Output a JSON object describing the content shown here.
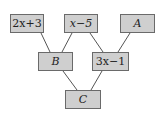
{
  "diagram": {
    "type": "tree",
    "colors": {
      "box_fill": "#cfcfcf",
      "box_border": "#6a6a6a",
      "edge": "#555555"
    },
    "nodes": [
      {
        "id": "n1",
        "label": "2x+3",
        "x": 10,
        "y": 14,
        "w": 34,
        "h": 19
      },
      {
        "id": "n2",
        "label": "x−5",
        "x": 64,
        "y": 14,
        "w": 34,
        "h": 19
      },
      {
        "id": "n3",
        "label": "A",
        "x": 120,
        "y": 14,
        "w": 35,
        "h": 19
      },
      {
        "id": "n4",
        "label": "B",
        "x": 38,
        "y": 52,
        "w": 35,
        "h": 19
      },
      {
        "id": "n5",
        "label": "3x−1",
        "x": 92,
        "y": 52,
        "w": 37,
        "h": 19
      },
      {
        "id": "n6",
        "label": "C",
        "x": 65,
        "y": 90,
        "w": 36,
        "h": 19
      }
    ],
    "edges": [
      {
        "from": "n1",
        "to": "n4",
        "x1": 41,
        "y1": 33,
        "x2": 50,
        "y2": 52
      },
      {
        "from": "n2",
        "to": "n4",
        "x1": 72,
        "y1": 33,
        "x2": 62,
        "y2": 52
      },
      {
        "from": "n2",
        "to": "n5",
        "x1": 90,
        "y1": 33,
        "x2": 103,
        "y2": 52
      },
      {
        "from": "n3",
        "to": "n5",
        "x1": 130,
        "y1": 33,
        "x2": 118,
        "y2": 52
      },
      {
        "from": "n4",
        "to": "n6",
        "x1": 63,
        "y1": 71,
        "x2": 77,
        "y2": 90
      },
      {
        "from": "n5",
        "to": "n6",
        "x1": 102,
        "y1": 71,
        "x2": 91,
        "y2": 90
      }
    ]
  }
}
